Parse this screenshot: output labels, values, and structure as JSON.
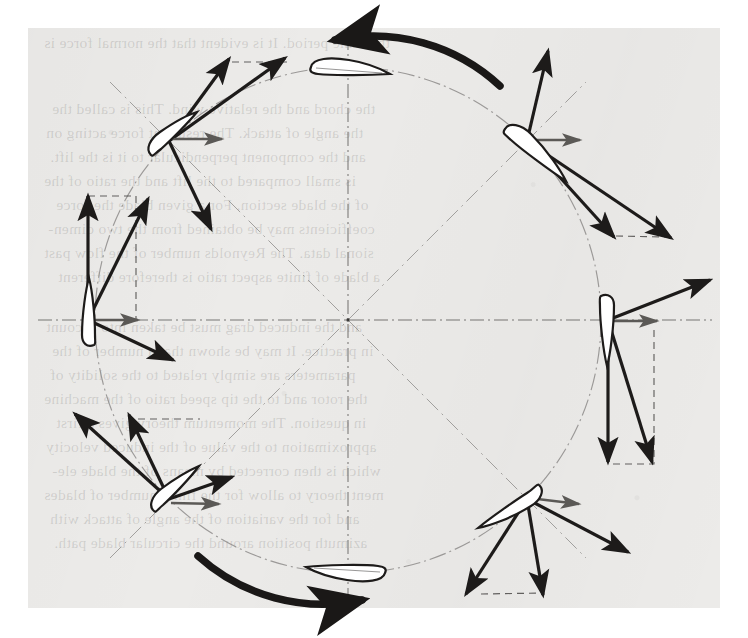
{
  "figure": {
    "kind": "cycloidal-rotor-velocity-diagram",
    "caption_visible": false,
    "rotation_sense": "counter-clockwise",
    "center": {
      "x": 348,
      "y": 320
    },
    "orbit_radius": 253,
    "background_color": "#ecebe9",
    "ink_color": "#1d1b1a",
    "gray_vector_color": "#5b5956",
    "construction_line_color": "#7a7876"
  },
  "chart_data": {
    "type": "scatter",
    "title": "",
    "xlabel": "",
    "ylabel": "",
    "grid": false,
    "legend": false,
    "categories": [
      "90",
      "45",
      "0",
      "315",
      "270",
      "225",
      "180",
      "135"
    ],
    "series": [
      {
        "name": "azimuth_deg",
        "values": [
          90,
          45,
          0,
          315,
          270,
          225,
          180,
          135
        ]
      },
      {
        "name": "blade_x",
        "values": [
          348,
          527,
          608,
          527,
          348,
          169,
          88,
          169
        ]
      },
      {
        "name": "blade_y",
        "values": [
          67,
          141,
          320,
          499,
          573,
          499,
          320,
          141
        ]
      },
      {
        "name": "blade_pitch_deg",
        "values": [
          4,
          36,
          84,
          128,
          178,
          214,
          262,
          310
        ]
      },
      {
        "name": "freestream_vector_deg",
        "values": [
          0,
          0,
          0,
          0,
          0,
          0,
          0,
          0
        ]
      },
      {
        "name": "n_black_vectors",
        "values": [
          3,
          3,
          3,
          3,
          3,
          3,
          3,
          3
        ]
      }
    ]
  },
  "blades": [
    {
      "id": "blade-top",
      "azimuth": "90",
      "label": "",
      "pitch_deg": 4,
      "cx": 348,
      "cy": 67,
      "has_rotor_arrow": true,
      "rotor_arrow_dir": "left"
    },
    {
      "id": "blade-upper-right",
      "azimuth": "45",
      "label": "",
      "pitch_deg": 36,
      "cx": 527,
      "cy": 141,
      "has_rotor_arrow": false,
      "rotor_arrow_dir": ""
    },
    {
      "id": "blade-right",
      "azimuth": "0",
      "label": "",
      "pitch_deg": 84,
      "cx": 608,
      "cy": 320,
      "has_rotor_arrow": false,
      "rotor_arrow_dir": ""
    },
    {
      "id": "blade-lower-right",
      "azimuth": "315",
      "label": "",
      "pitch_deg": 128,
      "cx": 527,
      "cy": 499,
      "has_rotor_arrow": false,
      "rotor_arrow_dir": ""
    },
    {
      "id": "blade-bottom",
      "azimuth": "270",
      "label": "",
      "pitch_deg": 178,
      "cx": 348,
      "cy": 573,
      "has_rotor_arrow": true,
      "rotor_arrow_dir": "right"
    },
    {
      "id": "blade-lower-left",
      "azimuth": "225",
      "label": "",
      "pitch_deg": 214,
      "cx": 169,
      "cy": 499,
      "has_rotor_arrow": false,
      "rotor_arrow_dir": ""
    },
    {
      "id": "blade-left",
      "azimuth": "180",
      "label": "",
      "pitch_deg": 262,
      "cx": 88,
      "cy": 320,
      "has_rotor_arrow": false,
      "rotor_arrow_dir": ""
    },
    {
      "id": "blade-upper-left",
      "azimuth": "135",
      "label": "",
      "pitch_deg": 310,
      "cx": 169,
      "cy": 141,
      "has_rotor_arrow": false,
      "rotor_arrow_dir": ""
    }
  ],
  "bleed_text": [
    {
      "t": "the same period. It is evident that the normal force is",
      "x": 44,
      "y": 34
    },
    {
      "t": "the chord and the relative wind. This is called the",
      "x": 52,
      "y": 100
    },
    {
      "t": "the angle of attack. The resultant force acting on",
      "x": 46,
      "y": 124
    },
    {
      "t": "and the component perpendicular to it is the lift.",
      "x": 50,
      "y": 148
    },
    {
      "t": "is small compared to the lift and the ratio of the",
      "x": 44,
      "y": 172
    },
    {
      "t": "of the blade section. For a given blade the force",
      "x": 56,
      "y": 196
    },
    {
      "t": "coefficients may be obtained from the two dimen-",
      "x": 48,
      "y": 220
    },
    {
      "t": "sional data. The Reynolds number of the flow past",
      "x": 44,
      "y": 244
    },
    {
      "t": "a blade of finite aspect ratio is therefore different",
      "x": 58,
      "y": 268
    },
    {
      "t": "and the induced drag must be taken into account",
      "x": 46,
      "y": 318
    },
    {
      "t": "in practice. It may be shown that a number of the",
      "x": 52,
      "y": 342
    },
    {
      "t": "parameters are simply related to the solidity of",
      "x": 50,
      "y": 366
    },
    {
      "t": "the rotor and to the tip speed ratio of the machine",
      "x": 44,
      "y": 390
    },
    {
      "t": "in question. The momentum theory gives a first",
      "x": 56,
      "y": 414
    },
    {
      "t": "approximation to the value of the induced velocity",
      "x": 46,
      "y": 438
    },
    {
      "t": "which is then corrected by means of the blade ele-",
      "x": 52,
      "y": 462
    },
    {
      "t": "ment theory to allow for the finite number of blades",
      "x": 44,
      "y": 486
    },
    {
      "t": "and for the variation of the angle of attack with",
      "x": 50,
      "y": 510
    },
    {
      "t": "azimuth position around the circular blade path.",
      "x": 54,
      "y": 534
    }
  ]
}
